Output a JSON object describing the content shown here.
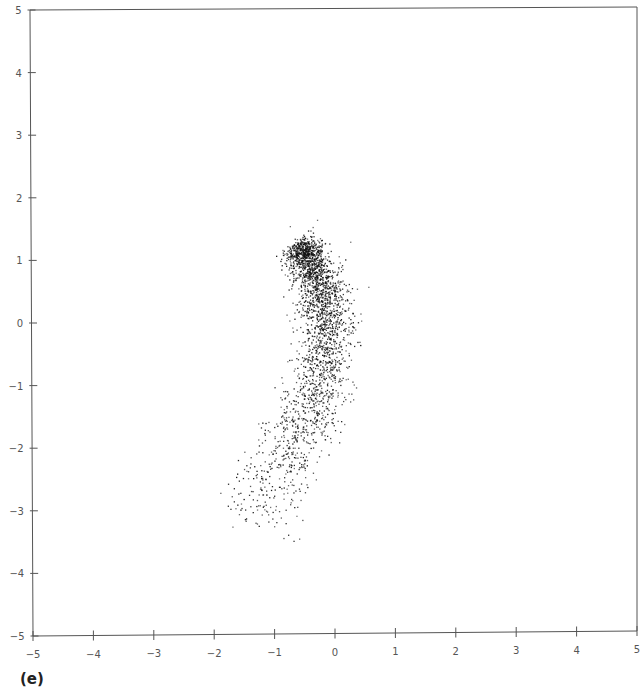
{
  "panel_label": "(e)",
  "colors": {
    "axis": "#555555",
    "point": "#111111",
    "background": "#ffffff"
  },
  "chart_data": {
    "type": "scatter",
    "title": "",
    "xlabel": "",
    "ylabel": "",
    "xlim": [
      -5,
      5
    ],
    "ylim": [
      -5,
      5
    ],
    "grid": false,
    "legend": null,
    "x_ticks": [
      -5,
      -4,
      -3,
      -2,
      -1,
      0,
      1,
      2,
      3,
      4,
      5
    ],
    "y_ticks": [
      -5,
      -4,
      -3,
      -2,
      -1,
      0,
      1,
      2,
      3,
      4,
      5
    ],
    "spine_curve": [
      {
        "x": -0.6,
        "y": 1.3,
        "weight": 4.0,
        "spread": 0.09
      },
      {
        "x": -0.45,
        "y": 1.0,
        "weight": 4.0,
        "spread": 0.1
      },
      {
        "x": -0.25,
        "y": 0.6,
        "weight": 2.5,
        "spread": 0.12
      },
      {
        "x": -0.15,
        "y": 0.2,
        "weight": 2.2,
        "spread": 0.13
      },
      {
        "x": -0.12,
        "y": -0.2,
        "weight": 2.0,
        "spread": 0.14
      },
      {
        "x": -0.2,
        "y": -0.7,
        "weight": 1.8,
        "spread": 0.15
      },
      {
        "x": -0.35,
        "y": -1.2,
        "weight": 1.6,
        "spread": 0.16
      },
      {
        "x": -0.55,
        "y": -1.7,
        "weight": 1.2,
        "spread": 0.17
      },
      {
        "x": -0.85,
        "y": -2.2,
        "weight": 0.9,
        "spread": 0.18
      },
      {
        "x": -1.15,
        "y": -2.7,
        "weight": 0.6,
        "spread": 0.2
      },
      {
        "x": -1.5,
        "y": -3.15,
        "weight": 0.3,
        "spread": 0.2
      }
    ],
    "n_points": 2600,
    "outliers": [
      {
        "x": 0.55,
        "y": 0.58
      },
      {
        "x": 0.25,
        "y": 1.3
      },
      {
        "x": -0.3,
        "y": 1.65
      },
      {
        "x": -1.7,
        "y": -3.25
      },
      {
        "x": 0.1,
        "y": 0.9
      },
      {
        "x": -0.75,
        "y": 1.55
      }
    ]
  }
}
